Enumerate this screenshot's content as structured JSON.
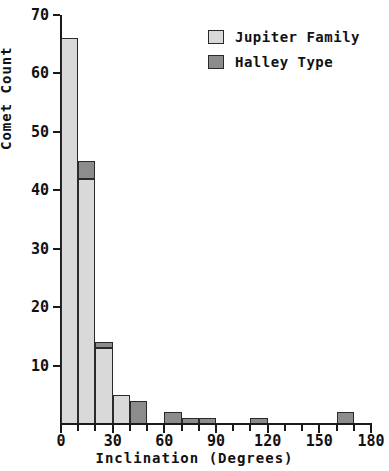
{
  "chart_data": {
    "type": "bar",
    "title": "",
    "subtitle": "",
    "xlabel": "Inclination (Degrees)",
    "ylabel": "Comet Count",
    "xlim": [
      0,
      180
    ],
    "ylim": [
      0,
      70
    ],
    "xticks": [
      0,
      30,
      60,
      90,
      120,
      150,
      180
    ],
    "xtick_labels": [
      "0",
      "30",
      "60",
      "90",
      "120",
      "150",
      "180"
    ],
    "yticks": [
      10,
      20,
      30,
      40,
      50,
      60,
      70
    ],
    "ytick_labels": [
      "10",
      "20",
      "30",
      "40",
      "50",
      "60",
      "70"
    ],
    "x_minor_ticks": [
      10,
      20,
      40,
      50,
      70,
      80,
      100,
      110,
      130,
      140,
      160,
      170
    ],
    "grid": false,
    "stacked": true,
    "bin_width": 10,
    "legend_position": "top-right",
    "legend": [
      {
        "name": "Jupiter Family",
        "color": "#d9d9d9"
      },
      {
        "name": "Halley Type",
        "color": "#8c8c8c"
      }
    ],
    "bins": [
      {
        "x0": 0,
        "x1": 10,
        "jupiter_family": 66,
        "halley_type": 0
      },
      {
        "x0": 10,
        "x1": 20,
        "jupiter_family": 42,
        "halley_type": 3
      },
      {
        "x0": 20,
        "x1": 30,
        "jupiter_family": 13,
        "halley_type": 1
      },
      {
        "x0": 30,
        "x1": 40,
        "jupiter_family": 5,
        "halley_type": 0
      },
      {
        "x0": 40,
        "x1": 50,
        "jupiter_family": 0,
        "halley_type": 4
      },
      {
        "x0": 50,
        "x1": 60,
        "jupiter_family": 0,
        "halley_type": 0
      },
      {
        "x0": 60,
        "x1": 70,
        "jupiter_family": 0,
        "halley_type": 2
      },
      {
        "x0": 70,
        "x1": 80,
        "jupiter_family": 0,
        "halley_type": 1
      },
      {
        "x0": 80,
        "x1": 90,
        "jupiter_family": 0,
        "halley_type": 1
      },
      {
        "x0": 90,
        "x1": 100,
        "jupiter_family": 0,
        "halley_type": 0
      },
      {
        "x0": 100,
        "x1": 110,
        "jupiter_family": 0,
        "halley_type": 0
      },
      {
        "x0": 110,
        "x1": 120,
        "jupiter_family": 0,
        "halley_type": 1
      },
      {
        "x0": 120,
        "x1": 130,
        "jupiter_family": 0,
        "halley_type": 0
      },
      {
        "x0": 130,
        "x1": 140,
        "jupiter_family": 0,
        "halley_type": 0
      },
      {
        "x0": 140,
        "x1": 150,
        "jupiter_family": 0,
        "halley_type": 0
      },
      {
        "x0": 150,
        "x1": 160,
        "jupiter_family": 0,
        "halley_type": 0
      },
      {
        "x0": 160,
        "x1": 170,
        "jupiter_family": 0,
        "halley_type": 2
      },
      {
        "x0": 170,
        "x1": 180,
        "jupiter_family": 0,
        "halley_type": 0
      }
    ],
    "series": [
      {
        "name": "Jupiter Family",
        "color": "#d9d9d9",
        "values": [
          66,
          42,
          13,
          5,
          0,
          0,
          0,
          0,
          0,
          0,
          0,
          0,
          0,
          0,
          0,
          0,
          0,
          0
        ]
      },
      {
        "name": "Halley Type",
        "color": "#8c8c8c",
        "values": [
          0,
          3,
          1,
          0,
          4,
          0,
          2,
          1,
          1,
          0,
          0,
          1,
          0,
          0,
          0,
          0,
          2,
          0
        ]
      }
    ],
    "colors": {
      "jupiter_family": "#d9d9d9",
      "halley_type": "#8c8c8c",
      "outline": "#2a2a2a",
      "axis": "#1a1a1a",
      "text": "#111111",
      "background": "#ffffff"
    }
  }
}
